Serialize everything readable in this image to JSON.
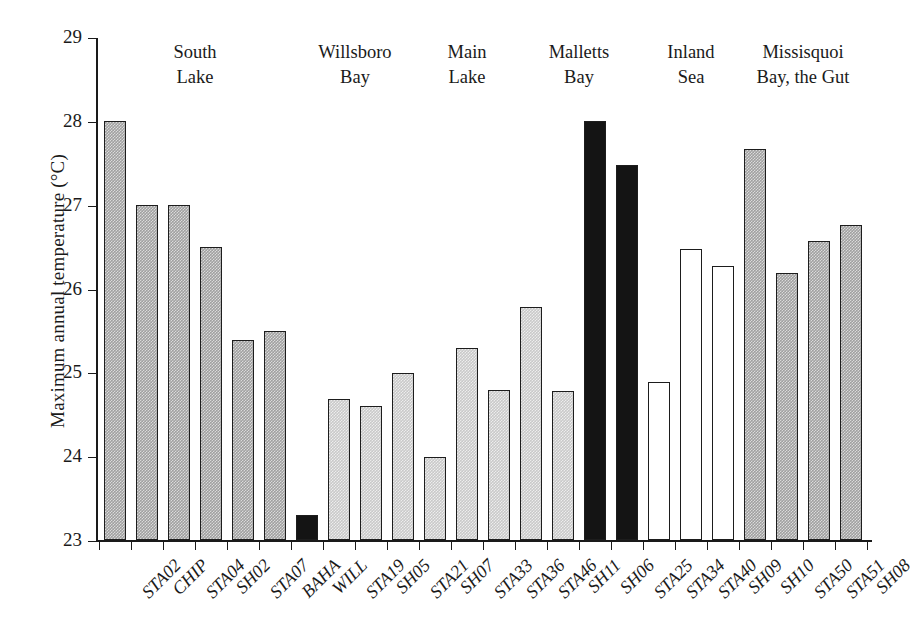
{
  "chart_data": {
    "type": "bar",
    "title": "",
    "xlabel": "",
    "ylabel": "Maximum annual temperature (°C)",
    "ylim": [
      23,
      29
    ],
    "yticks": [
      23,
      24,
      25,
      26,
      27,
      28,
      29
    ],
    "ytick_labels": [
      "23",
      "24",
      "25",
      "26",
      "27",
      "28",
      "29"
    ],
    "grid": false,
    "legend": "none",
    "categories": [
      "STA02",
      "CHIP",
      "STA04",
      "SH02",
      "STA07",
      "BAHA",
      "WILL",
      "STA19",
      "SH05",
      "STA21",
      "SH07",
      "STA33",
      "STA36",
      "STA46",
      "SH11",
      "SH06",
      "STA25",
      "STA34",
      "STA40",
      "SH09",
      "SH10",
      "STA50",
      "STA51",
      "SH08"
    ],
    "values": [
      28.0,
      27.0,
      27.0,
      26.49,
      25.39,
      25.49,
      23.3,
      24.68,
      24.6,
      24.99,
      23.99,
      25.29,
      24.79,
      25.78,
      24.78,
      28.0,
      27.47,
      24.88,
      26.47,
      26.27,
      27.67,
      26.18,
      26.57,
      26.76
    ],
    "bar_styles": [
      "medium-gray",
      "medium-gray",
      "medium-gray",
      "medium-gray",
      "medium-gray",
      "medium-gray",
      "black",
      "light-gray",
      "light-gray",
      "light-gray",
      "light-gray",
      "light-gray",
      "light-gray",
      "light-gray",
      "light-gray",
      "black",
      "black",
      "white",
      "white",
      "white",
      "medium-gray",
      "medium-gray",
      "medium-gray",
      "medium-gray"
    ],
    "groups": [
      {
        "label": "South\nLake",
        "members": [
          "STA02",
          "CHIP",
          "STA04",
          "SH02",
          "STA07",
          "BAHA"
        ]
      },
      {
        "label": "Willsboro\nBay",
        "members": [
          "WILL",
          "STA19",
          "SH05",
          "STA21"
        ]
      },
      {
        "label": "Main\nLake",
        "members": [
          "SH07",
          "STA33",
          "STA36"
        ]
      },
      {
        "label": "Malletts\nBay",
        "members": [
          "STA46",
          "SH11",
          "SH06",
          "STA25"
        ]
      },
      {
        "label": "Inland\nSea",
        "members": [
          "STA34",
          "STA40",
          "SH09"
        ]
      },
      {
        "label": "Missisquoi\nBay, the Gut",
        "members": [
          "SH10",
          "STA50",
          "STA51",
          "SH08"
        ]
      }
    ],
    "group_labels": [
      "South\nLake",
      "Willsboro\nBay",
      "Main\nLake",
      "Malletts\nBay",
      "Inland\nSea",
      "Missisquoi\nBay, the Gut"
    ],
    "colors": {
      "medium-gray": "#a0a0a0",
      "light-gray": "#c9c9c9",
      "black": "#141414",
      "white": "#ffffff",
      "axis": "#1a1a1a"
    }
  }
}
